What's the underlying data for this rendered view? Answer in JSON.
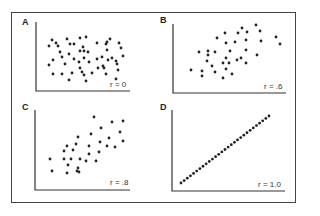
{
  "chart_data": [
    {
      "type": "scatter",
      "panel_label": "A",
      "annotation": "r = 0",
      "r": 0,
      "axes": {
        "x0": 36,
        "y0": 91,
        "x1": 130,
        "ytop": 22
      },
      "points": [
        [
          52,
          40
        ],
        [
          56,
          43
        ],
        [
          67,
          39
        ],
        [
          80,
          38
        ],
        [
          86,
          37
        ],
        [
          49,
          46
        ],
        [
          58,
          46
        ],
        [
          70,
          44
        ],
        [
          74,
          44
        ],
        [
          83,
          47
        ],
        [
          97,
          43
        ],
        [
          106,
          44
        ],
        [
          110,
          39
        ],
        [
          107,
          42
        ],
        [
          119,
          43
        ],
        [
          121,
          48
        ],
        [
          60,
          52
        ],
        [
          80,
          51
        ],
        [
          84,
          51
        ],
        [
          88,
          52
        ],
        [
          69,
          54
        ],
        [
          107,
          50
        ],
        [
          53,
          60
        ],
        [
          62,
          57
        ],
        [
          74,
          59
        ],
        [
          84,
          58
        ],
        [
          97,
          59
        ],
        [
          102,
          57
        ],
        [
          108,
          60
        ],
        [
          112,
          58
        ],
        [
          116,
          61
        ],
        [
          123,
          56
        ],
        [
          65,
          64
        ],
        [
          79,
          62
        ],
        [
          89,
          62
        ],
        [
          49,
          65
        ],
        [
          103,
          66
        ],
        [
          117,
          64
        ],
        [
          80,
          68
        ],
        [
          98,
          68
        ],
        [
          104,
          68
        ],
        [
          82,
          72
        ],
        [
          53,
          74
        ],
        [
          62,
          74
        ],
        [
          72,
          73
        ],
        [
          84,
          75
        ],
        [
          92,
          73
        ],
        [
          106,
          74
        ],
        [
          118,
          70
        ],
        [
          69,
          80
        ],
        [
          86,
          81
        ],
        [
          116,
          79
        ]
      ]
    },
    {
      "type": "scatter",
      "panel_label": "B",
      "annotation": "r = .6",
      "r": 0.6,
      "axes": {
        "x0": 173,
        "y0": 93,
        "x1": 286,
        "ytop": 24
      },
      "points": [
        [
          256,
          25
        ],
        [
          242,
          28
        ],
        [
          260,
          31
        ],
        [
          247,
          32
        ],
        [
          238,
          33
        ],
        [
          225,
          33
        ],
        [
          217,
          38
        ],
        [
          276,
          37
        ],
        [
          261,
          41
        ],
        [
          246,
          40
        ],
        [
          235,
          42
        ],
        [
          226,
          43
        ],
        [
          280,
          44
        ],
        [
          199,
          52
        ],
        [
          208,
          51
        ],
        [
          215,
          52
        ],
        [
          230,
          51
        ],
        [
          246,
          50
        ],
        [
          257,
          55
        ],
        [
          208,
          55
        ],
        [
          241,
          58
        ],
        [
          226,
          58
        ],
        [
          237,
          60
        ],
        [
          223,
          63
        ],
        [
          207,
          61
        ],
        [
          246,
          63
        ],
        [
          212,
          66
        ],
        [
          229,
          63
        ],
        [
          191,
          70
        ],
        [
          202,
          71
        ],
        [
          226,
          69
        ],
        [
          215,
          72
        ],
        [
          232,
          74
        ],
        [
          202,
          76
        ],
        [
          223,
          78
        ]
      ]
    },
    {
      "type": "scatter",
      "panel_label": "C",
      "annotation": "r = .8",
      "r": 0.8,
      "axes": {
        "x0": 35,
        "y0": 190,
        "x1": 130,
        "ytop": 110
      },
      "points": [
        [
          94,
          117
        ],
        [
          112,
          122
        ],
        [
          123,
          121
        ],
        [
          101,
          128
        ],
        [
          78,
          137
        ],
        [
          120,
          132
        ],
        [
          91,
          134
        ],
        [
          109,
          138
        ],
        [
          123,
          141
        ],
        [
          67,
          146
        ],
        [
          76,
          144
        ],
        [
          89,
          146
        ],
        [
          100,
          142
        ],
        [
          107,
          146
        ],
        [
          115,
          147
        ],
        [
          73,
          150
        ],
        [
          64,
          151
        ],
        [
          99,
          152
        ],
        [
          89,
          154
        ],
        [
          50,
          159
        ],
        [
          64,
          159
        ],
        [
          71,
          159
        ],
        [
          80,
          159
        ],
        [
          68,
          165
        ],
        [
          96,
          161
        ],
        [
          86,
          161
        ],
        [
          78,
          168
        ],
        [
          52,
          171
        ],
        [
          67,
          173
        ],
        [
          77,
          171
        ],
        [
          79,
          172
        ]
      ]
    },
    {
      "type": "scatter",
      "panel_label": "D",
      "annotation": "r = 1.0",
      "r": 1.0,
      "axes": {
        "x0": 172,
        "y0": 191,
        "x1": 285,
        "ytop": 110
      },
      "line_points": {
        "start": [
          181,
          183
        ],
        "end": [
          269,
          116
        ],
        "count": 29
      }
    }
  ],
  "figure": {
    "panels": [
      "A",
      "B",
      "C",
      "D"
    ],
    "labels": {
      "A": "r = 0",
      "B": "r = .6",
      "C": "r = .8",
      "D": "r = 1.0"
    }
  }
}
